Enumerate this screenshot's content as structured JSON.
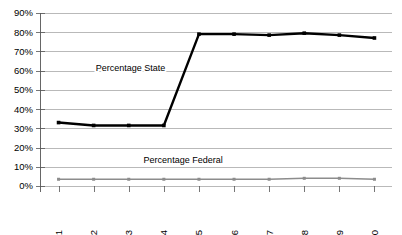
{
  "chart_data": {
    "type": "line",
    "title": "",
    "subtitle": "",
    "xlabel": "",
    "ylabel": "",
    "categories": [
      "1991",
      "1992",
      "1993",
      "1994",
      "1995",
      "1996",
      "1997",
      "1998",
      "1999",
      "2000"
    ],
    "ylim": [
      0,
      90
    ],
    "ytick_labels": [
      "0%",
      "10%",
      "20%",
      "30%",
      "40%",
      "50%",
      "60%",
      "70%",
      "80%",
      "90%"
    ],
    "ytick_values": [
      0,
      10,
      20,
      30,
      40,
      50,
      60,
      70,
      80,
      90
    ],
    "grid": true,
    "legend_position": "inline-annotation",
    "series": [
      {
        "name": "Percentage State",
        "color": "#000000",
        "values": [
          33,
          31.5,
          31.5,
          31.5,
          79,
          79,
          78.5,
          79.5,
          78.5,
          77
        ]
      },
      {
        "name": "Percentage Federal",
        "color": "#8c8c8c",
        "values": [
          3.5,
          3.5,
          3.5,
          3.5,
          3.5,
          3.5,
          3.5,
          4,
          4,
          3.5
        ]
      }
    ],
    "annotations": [
      {
        "text": "Percentage State",
        "x": 1993.05,
        "y": 60
      },
      {
        "text": "Percentage Federal",
        "x": 1994.55,
        "y": 12
      }
    ]
  },
  "axis": {
    "y_label_0": "0%",
    "y_label_10": "10%",
    "y_label_20": "20%",
    "y_label_30": "30%",
    "y_label_40": "40%",
    "y_label_50": "50%",
    "y_label_60": "60%",
    "y_label_70": "70%",
    "y_label_80": "80%",
    "y_label_90": "90%"
  }
}
